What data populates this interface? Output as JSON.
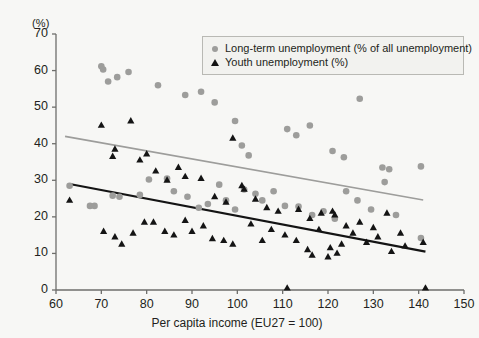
{
  "chart_data": {
    "type": "scatter",
    "title": "",
    "xlabel": "Per capita income (EU27 = 100)",
    "ylabel": "(%)",
    "xlim": [
      60,
      150
    ],
    "ylim": [
      0,
      70
    ],
    "xticks": [
      60,
      70,
      80,
      90,
      100,
      110,
      120,
      130,
      140,
      150
    ],
    "yticks": [
      0,
      10,
      20,
      30,
      40,
      50,
      60,
      70
    ],
    "grid": false,
    "legend_position": "top-right",
    "colors": {
      "long_term_marker": "#9d9d9b",
      "youth_marker": "#141414",
      "long_term_trend": "#9d9d9b",
      "youth_trend": "#141414",
      "background": "#f7f7f5",
      "axis": "#6e6e6b"
    },
    "series": [
      {
        "name": "Long-term unemployment (% of all unemployment)",
        "marker": "circle",
        "color": "#9d9d9b",
        "points": [
          [
            63.0,
            28.5
          ],
          [
            70.0,
            61.2
          ],
          [
            70.4,
            60.3
          ],
          [
            71.5,
            57.0
          ],
          [
            73.5,
            58.2
          ],
          [
            76.0,
            59.6
          ],
          [
            82.5,
            56.0
          ],
          [
            88.5,
            53.3
          ],
          [
            92.0,
            54.2
          ],
          [
            95.0,
            51.3
          ],
          [
            99.5,
            46.2
          ],
          [
            101.0,
            39.5
          ],
          [
            102.5,
            36.8
          ],
          [
            111.0,
            44.0
          ],
          [
            113.0,
            42.3
          ],
          [
            116.0,
            45.0
          ],
          [
            121.0,
            38.0
          ],
          [
            123.5,
            36.3
          ],
          [
            127.0,
            52.3
          ],
          [
            132.0,
            33.5
          ],
          [
            133.5,
            33.0
          ],
          [
            140.5,
            33.8
          ],
          [
            72.5,
            25.8
          ],
          [
            74.0,
            25.5
          ],
          [
            78.5,
            26.0
          ],
          [
            80.5,
            30.2
          ],
          [
            84.5,
            30.5
          ],
          [
            86.0,
            27.0
          ],
          [
            89.0,
            25.5
          ],
          [
            91.5,
            22.5
          ],
          [
            93.5,
            23.5
          ],
          [
            96.0,
            28.8
          ],
          [
            97.5,
            24.5
          ],
          [
            99.5,
            22.0
          ],
          [
            101.5,
            27.5
          ],
          [
            104.0,
            26.3
          ],
          [
            105.5,
            24.5
          ],
          [
            108.0,
            27.0
          ],
          [
            110.5,
            23.0
          ],
          [
            113.5,
            22.8
          ],
          [
            116.5,
            20.5
          ],
          [
            119.0,
            21.5
          ],
          [
            121.5,
            19.5
          ],
          [
            124.0,
            27.0
          ],
          [
            126.5,
            24.5
          ],
          [
            129.5,
            22.0
          ],
          [
            132.5,
            29.5
          ],
          [
            135.0,
            20.5
          ],
          [
            140.5,
            14.2
          ],
          [
            67.5,
            23.0
          ],
          [
            68.5,
            23.0
          ]
        ]
      },
      {
        "name": "Youth unemployment (%)",
        "marker": "triangle",
        "color": "#141414",
        "points": [
          [
            63.0,
            24.5
          ],
          [
            70.0,
            45.0
          ],
          [
            73.0,
            38.5
          ],
          [
            72.5,
            36.5
          ],
          [
            76.5,
            46.2
          ],
          [
            80.0,
            37.2
          ],
          [
            78.5,
            35.5
          ],
          [
            82.0,
            32.5
          ],
          [
            84.5,
            30.0
          ],
          [
            87.0,
            33.5
          ],
          [
            88.5,
            31.0
          ],
          [
            92.0,
            30.5
          ],
          [
            99.0,
            41.5
          ],
          [
            95.0,
            25.5
          ],
          [
            97.5,
            24.0
          ],
          [
            101.0,
            28.5
          ],
          [
            101.5,
            27.5
          ],
          [
            104.0,
            24.8
          ],
          [
            106.5,
            22.5
          ],
          [
            109.0,
            21.5
          ],
          [
            111.0,
            0.5
          ],
          [
            113.5,
            22.0
          ],
          [
            116.0,
            19.5
          ],
          [
            118.5,
            21.0
          ],
          [
            121.0,
            21.5
          ],
          [
            121.5,
            20.5
          ],
          [
            124.0,
            17.5
          ],
          [
            127.0,
            18.5
          ],
          [
            130.0,
            17.0
          ],
          [
            133.0,
            21.0
          ],
          [
            136.0,
            15.5
          ],
          [
            141.0,
            13.0
          ],
          [
            141.5,
            0.5
          ],
          [
            70.5,
            16.0
          ],
          [
            73.0,
            14.5
          ],
          [
            74.5,
            12.5
          ],
          [
            77.0,
            15.5
          ],
          [
            79.5,
            18.5
          ],
          [
            81.5,
            18.5
          ],
          [
            84.0,
            16.0
          ],
          [
            86.0,
            15.0
          ],
          [
            88.5,
            19.0
          ],
          [
            90.0,
            16.0
          ],
          [
            92.5,
            17.5
          ],
          [
            94.5,
            14.0
          ],
          [
            97.0,
            13.5
          ],
          [
            99.0,
            12.5
          ],
          [
            103.0,
            18.0
          ],
          [
            105.5,
            13.5
          ],
          [
            107.5,
            16.5
          ],
          [
            110.5,
            15.0
          ],
          [
            113.0,
            13.5
          ],
          [
            115.5,
            11.0
          ],
          [
            118.0,
            16.5
          ],
          [
            120.5,
            11.5
          ],
          [
            123.0,
            12.5
          ],
          [
            125.5,
            15.5
          ],
          [
            128.5,
            13.0
          ],
          [
            131.0,
            14.5
          ],
          [
            134.0,
            10.5
          ],
          [
            137.0,
            12.0
          ],
          [
            120.0,
            9.0
          ],
          [
            122.0,
            10.0
          ],
          [
            116.5,
            9.5
          ]
        ]
      }
    ],
    "trendlines": [
      {
        "name": "Long-term unemployment trend",
        "color": "#9d9d9b",
        "x0": 62.0,
        "y0": 42.0,
        "x1": 141.0,
        "y1": 24.6
      },
      {
        "name": "Youth unemployment trend",
        "color": "#141414",
        "x0": 63.0,
        "y0": 29.0,
        "x1": 141.5,
        "y1": 10.5
      }
    ]
  },
  "legend": {
    "items": [
      {
        "label": "Long-term unemployment (% of all unemployment)",
        "marker": "circle"
      },
      {
        "label": "Youth unemployment (%)",
        "marker": "triangle"
      }
    ]
  }
}
